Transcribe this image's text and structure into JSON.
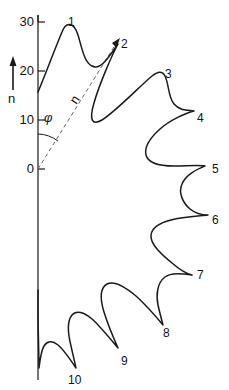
{
  "figure": {
    "kind": "polar-star-plot",
    "background_color": "#ffffff",
    "stroke_color": "#1a1a1a",
    "dashed_color": "#555555"
  },
  "axis": {
    "orientation": "vertical",
    "label": "n",
    "arrow_name": "up-arrow-icon",
    "ticks": [
      {
        "value": "30",
        "y": 22
      },
      {
        "value": "20",
        "y": 71
      },
      {
        "value": "10",
        "y": 120
      },
      {
        "value": "0",
        "y": 169
      }
    ]
  },
  "annotations": {
    "angle_symbol": "φ",
    "radial_vector_label": "n"
  },
  "chart_data": {
    "type": "line",
    "title": "",
    "xlabel": "",
    "ylabel": "n",
    "ylim": [
      0,
      30
    ],
    "yticks": [
      0,
      10,
      20,
      30
    ],
    "grid": false,
    "legend": null,
    "point_labels": [
      {
        "label": "1",
        "x": 68,
        "y": 16
      },
      {
        "label": "2",
        "x": 121,
        "y": 38
      },
      {
        "label": "3",
        "x": 165,
        "y": 68
      },
      {
        "label": "4",
        "x": 197,
        "y": 112
      },
      {
        "label": "5",
        "x": 212,
        "y": 163
      },
      {
        "label": "6",
        "x": 212,
        "y": 214
      },
      {
        "label": "7",
        "x": 197,
        "y": 269
      },
      {
        "label": "8",
        "x": 163,
        "y": 327
      },
      {
        "label": "9",
        "x": 121,
        "y": 355
      },
      {
        "label": "10",
        "x": 68,
        "y": 374
      }
    ],
    "lobe_tips_polar": [
      {
        "index": 1,
        "n": 30.0,
        "phi_deg": 10
      },
      {
        "index": 2,
        "n": 26.5,
        "phi_deg": 33
      },
      {
        "index": 3,
        "n": 22.0,
        "phi_deg": 58
      },
      {
        "index": 4,
        "n": 16.5,
        "phi_deg": 83
      },
      {
        "index": 5,
        "n": 12.5,
        "phi_deg": 108
      },
      {
        "index": 6,
        "n": 12.5,
        "phi_deg": 133
      },
      {
        "index": 7,
        "n": 16.5,
        "phi_deg": 158
      },
      {
        "index": 8,
        "n": 22.0,
        "phi_deg": 183
      },
      {
        "index": 9,
        "n": 26.5,
        "phi_deg": 208
      },
      {
        "index": 10,
        "n": 30.0,
        "phi_deg": 233
      }
    ]
  }
}
